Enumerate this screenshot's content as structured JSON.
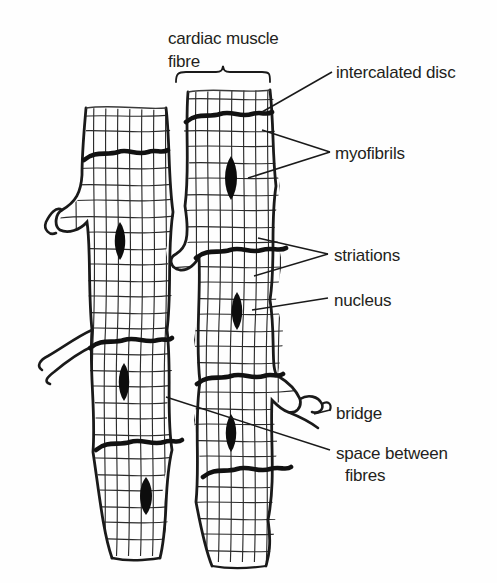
{
  "figure": {
    "background_color": "#fefefe",
    "ink_color": "#231f20",
    "striation_color": "#2b2b2b"
  },
  "labels": {
    "cardiac_muscle_line1": "cardiac muscle",
    "cardiac_muscle_line2": "fibre",
    "intercalated_disc": "intercalated disc",
    "myofibrils": "myofibrils",
    "striations": "striations",
    "nucleus": "nucleus",
    "bridge": "bridge",
    "space_between_line1": "space between",
    "space_between_line2": "fibres"
  },
  "structures": {
    "fibre_columns": [
      {
        "name": "left-fibre-column",
        "x_range": [
          48,
          170
        ]
      },
      {
        "name": "right-fibre-column",
        "x_range": [
          178,
          300
        ]
      }
    ],
    "nuclei": [
      {
        "cx": 120,
        "cy": 240
      },
      {
        "cx": 231,
        "cy": 176
      },
      {
        "cx": 237,
        "cy": 310
      },
      {
        "cx": 124,
        "cy": 381
      },
      {
        "cx": 231,
        "cy": 432
      },
      {
        "cx": 146,
        "cy": 495
      }
    ],
    "intercalated_discs": [
      {
        "y": 154,
        "x_range": [
          85,
          160
        ]
      },
      {
        "y": 116,
        "x_range": [
          186,
          272
        ]
      },
      {
        "y": 252,
        "x_range": [
          196,
          285
        ]
      },
      {
        "y": 341,
        "x_range": [
          88,
          170
        ]
      },
      {
        "y": 378,
        "x_range": [
          196,
          282
        ]
      },
      {
        "y": 444,
        "x_range": [
          96,
          180
        ]
      },
      {
        "y": 471,
        "x_range": [
          203,
          290
        ]
      }
    ],
    "bridges": [
      {
        "name": "bridge-left-upper",
        "x": 52,
        "y": 222
      },
      {
        "name": "bridge-left-lower",
        "x": 40,
        "y": 360
      },
      {
        "name": "bridge-right-upper",
        "x": 296,
        "y": 400
      },
      {
        "name": "bridge-right-lower",
        "x": 300,
        "y": 420
      }
    ]
  }
}
